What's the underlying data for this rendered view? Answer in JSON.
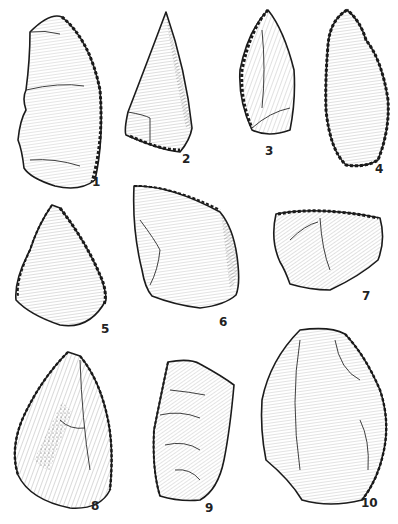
{
  "figure": {
    "background": "#ffffff",
    "ink_color": "#1a1a1a",
    "artifacts": [
      {
        "number": "1",
        "label_pos": [
          92,
          182
        ]
      },
      {
        "number": "2",
        "label_pos": [
          182,
          158
        ]
      },
      {
        "number": "3",
        "label_pos": [
          266,
          150
        ]
      },
      {
        "number": "4",
        "label_pos": [
          374,
          167
        ]
      },
      {
        "number": "5",
        "label_pos": [
          101,
          327
        ]
      },
      {
        "number": "6",
        "label_pos": [
          219,
          320
        ]
      },
      {
        "number": "7",
        "label_pos": [
          363,
          296
        ]
      },
      {
        "number": "8",
        "label_pos": [
          92,
          507
        ]
      },
      {
        "number": "9",
        "label_pos": [
          206,
          508
        ]
      },
      {
        "number": "10",
        "label_pos": [
          362,
          503
        ]
      }
    ]
  }
}
